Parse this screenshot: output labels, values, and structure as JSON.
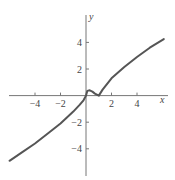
{
  "chart_data": {
    "type": "line",
    "title": "",
    "xlabel": "x",
    "ylabel": "y",
    "xlim": [
      -6.7,
      7.0
    ],
    "ylim": [
      -5.9,
      5.5
    ],
    "grid": false,
    "legend": null,
    "x_ticks": [
      -4,
      -2,
      2,
      4
    ],
    "y_ticks": [
      4,
      2,
      -2,
      -4
    ],
    "x_tick_labels": [
      "−4",
      "−2",
      "2",
      "4"
    ],
    "y_tick_labels": [
      "4",
      "2",
      "−2",
      "−4"
    ],
    "series": [
      {
        "name": "f(x)",
        "color": "#555555",
        "x": [
          -6.0,
          -5.0,
          -4.0,
          -3.0,
          -2.0,
          -1.5,
          -1.0,
          -0.5,
          -0.2,
          0.0,
          0.1,
          0.3,
          0.5,
          0.7,
          1.0,
          1.3,
          2.0,
          3.0,
          4.0,
          5.0,
          6.1
        ],
        "y": [
          -4.9,
          -4.25,
          -3.6,
          -2.85,
          -2.1,
          -1.65,
          -1.2,
          -0.7,
          -0.35,
          0.0,
          0.35,
          0.4,
          0.3,
          0.15,
          0.0,
          0.45,
          1.3,
          2.15,
          2.9,
          3.6,
          4.25
        ]
      }
    ]
  }
}
